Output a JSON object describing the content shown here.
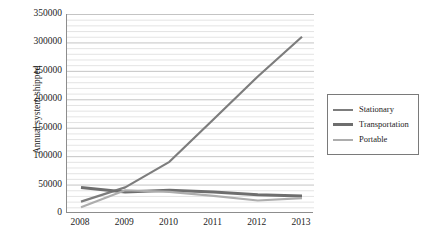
{
  "chart_data": {
    "type": "line",
    "title": "",
    "xlabel": "",
    "ylabel": "Annual system shipped",
    "categories": [
      "2008",
      "2009",
      "2010",
      "2011",
      "2012",
      "2013"
    ],
    "x": [
      2008,
      2009,
      2010,
      2011,
      2012,
      2013
    ],
    "ylim": [
      0,
      350000
    ],
    "ytick_labels": [
      "0",
      "50000",
      "100000",
      "150000",
      "200000",
      "250000",
      "300000",
      "350000"
    ],
    "yticks": [
      0,
      50000,
      100000,
      150000,
      200000,
      250000,
      300000,
      350000
    ],
    "ytick_minor_step": 10000,
    "grid": "horizontal",
    "legend_position": "right",
    "series": [
      {
        "name": "Stationary",
        "color": "#7d7d7d",
        "values": [
          20000,
          45000,
          90000,
          165000,
          240000,
          310000
        ]
      },
      {
        "name": "Transportation",
        "color": "#6e6e6e",
        "values": [
          45000,
          37000,
          40000,
          37000,
          32000,
          30000
        ]
      },
      {
        "name": "Portable",
        "color": "#adadad",
        "values": [
          10000,
          40000,
          37000,
          30000,
          22000,
          26000
        ]
      }
    ]
  },
  "legend": {
    "entries": [
      {
        "label": "Stationary",
        "color": "#7d7d7d",
        "thickness": "2.2px"
      },
      {
        "label": "Transportation",
        "color": "#6e6e6e",
        "thickness": "3px"
      },
      {
        "label": "Portable",
        "color": "#adadad",
        "thickness": "2.2px"
      }
    ]
  },
  "colors": {
    "axis": "#8d8d8d",
    "gridline_minor": "#d9d9d9",
    "gridline_major": "#bdbdbd",
    "text": "#1d1d1d",
    "background": "#ffffff"
  }
}
